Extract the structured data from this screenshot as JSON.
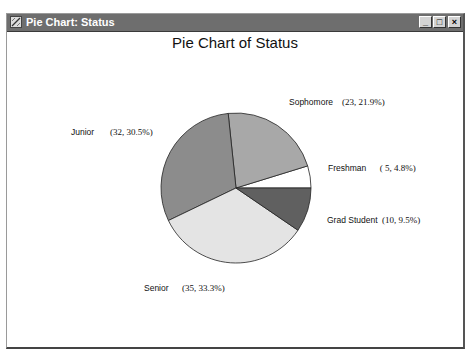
{
  "window": {
    "title": "Pie Chart: Status",
    "controls": {
      "minimize": "_",
      "maximize": "□",
      "close": "×"
    }
  },
  "chart_data": {
    "type": "pie",
    "title": "Pie Chart of Status",
    "categories": [
      "Freshman",
      "Sophomore",
      "Junior",
      "Senior",
      "Grad Student"
    ],
    "values": [
      5,
      23,
      32,
      35,
      10
    ],
    "percentages": [
      4.8,
      21.9,
      30.5,
      33.3,
      9.5
    ],
    "colors": [
      "#ffffff",
      "#a8a8a8",
      "#8c8c8c",
      "#e4e4e4",
      "#606060"
    ],
    "legend": "none (inline labels)",
    "labels": [
      {
        "name": "Freshman",
        "value_text": "( 5,  4.8%)"
      },
      {
        "name": "Sophomore",
        "value_text": "(23, 21.9%)"
      },
      {
        "name": "Junior",
        "value_text": "(32, 30.5%)"
      },
      {
        "name": "Senior",
        "value_text": "(35, 33.3%)"
      },
      {
        "name": "Grad Student",
        "value_text": "(10, 9.5%)"
      }
    ]
  }
}
